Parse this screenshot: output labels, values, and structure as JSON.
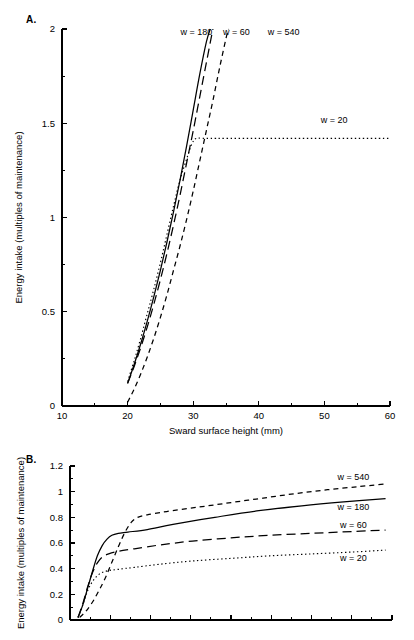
{
  "figure": {
    "panels": [
      {
        "letter": "A.",
        "xlabel": "Sward surface height (mm)",
        "ylabel": "Energy intake (multiples of maintenance)"
      },
      {
        "letter": "B.",
        "xlabel": "",
        "ylabel": "Energy intake (multiples of maintenance)"
      }
    ]
  },
  "chart_data": [
    {
      "type": "line",
      "panel": "A.",
      "title": "",
      "xlabel": "Sward surface height (mm)",
      "ylabel": "Energy intake (multiples of maintenance)",
      "xlim": [
        10,
        60
      ],
      "ylim": [
        0,
        2
      ],
      "xticks": [
        10,
        20,
        30,
        40,
        50,
        60
      ],
      "xticklabels": [
        "10",
        "20",
        "30",
        "40",
        "50",
        "60"
      ],
      "xminorticks": [
        15,
        25,
        35,
        45,
        55
      ],
      "yticks": [
        0,
        0.5,
        1,
        1.5,
        2
      ],
      "yticklabels": [
        "0",
        "0.5",
        "1",
        "1.5",
        "2"
      ],
      "yminorticks": [
        0.25,
        0.75,
        1.25,
        1.75
      ],
      "grid": false,
      "legend_position": "inline-top",
      "series": [
        {
          "name": "w = 180",
          "style": "solid",
          "label_x": 30.5,
          "label_y": 1.97,
          "points": [
            [
              20.0,
              0.12
            ],
            [
              21.0,
              0.22
            ],
            [
              22.0,
              0.33
            ],
            [
              23.0,
              0.45
            ],
            [
              24.0,
              0.58
            ],
            [
              25.0,
              0.72
            ],
            [
              26.0,
              0.87
            ],
            [
              27.0,
              1.03
            ],
            [
              28.0,
              1.2
            ],
            [
              29.0,
              1.38
            ],
            [
              30.0,
              1.57
            ],
            [
              31.0,
              1.76
            ],
            [
              32.0,
              1.93
            ],
            [
              32.6,
              2.0
            ]
          ]
        },
        {
          "name": "w = 60",
          "style": "longdash",
          "label_x": 36.6,
          "label_y": 1.97,
          "points": [
            [
              20.0,
              0.12
            ],
            [
              21.0,
              0.21
            ],
            [
              22.0,
              0.31
            ],
            [
              23.0,
              0.42
            ],
            [
              24.0,
              0.54
            ],
            [
              25.0,
              0.67
            ],
            [
              26.0,
              0.81
            ],
            [
              27.0,
              0.96
            ],
            [
              28.0,
              1.12
            ],
            [
              29.0,
              1.29
            ],
            [
              30.0,
              1.46
            ],
            [
              31.0,
              1.64
            ],
            [
              32.0,
              1.82
            ],
            [
              33.0,
              2.0
            ]
          ]
        },
        {
          "name": "w = 540",
          "style": "shortdash",
          "label_x": 43.8,
          "label_y": 1.97,
          "points": [
            [
              20.0,
              0.02
            ],
            [
              21.0,
              0.09
            ],
            [
              22.0,
              0.17
            ],
            [
              23.0,
              0.26
            ],
            [
              24.0,
              0.36
            ],
            [
              25.0,
              0.47
            ],
            [
              26.0,
              0.59
            ],
            [
              27.0,
              0.72
            ],
            [
              28.0,
              0.85
            ],
            [
              29.0,
              0.99
            ],
            [
              30.0,
              1.14
            ],
            [
              31.0,
              1.3
            ],
            [
              32.0,
              1.46
            ],
            [
              33.0,
              1.62
            ],
            [
              34.0,
              1.79
            ],
            [
              35.0,
              1.95
            ],
            [
              35.4,
              2.0
            ]
          ]
        },
        {
          "name": "w = 20",
          "style": "dotted",
          "label_x": 51.5,
          "label_y": 1.5,
          "points": [
            [
              20.0,
              0.13
            ],
            [
              21.0,
              0.24
            ],
            [
              22.0,
              0.36
            ],
            [
              23.0,
              0.49
            ],
            [
              24.0,
              0.62
            ],
            [
              25.0,
              0.76
            ],
            [
              26.0,
              0.91
            ],
            [
              27.0,
              1.06
            ],
            [
              28.0,
              1.2
            ],
            [
              29.0,
              1.31
            ],
            [
              29.8,
              1.39
            ],
            [
              30.5,
              1.42
            ],
            [
              32.0,
              1.42
            ],
            [
              40.0,
              1.42
            ],
            [
              50.0,
              1.42
            ],
            [
              60.0,
              1.42
            ]
          ]
        }
      ]
    },
    {
      "type": "line",
      "panel": "B.",
      "title": "",
      "xlabel": "",
      "ylabel": "Energy intake (multiples of maintenance)",
      "xlim": [
        0,
        100
      ],
      "ylim": [
        0,
        1.2
      ],
      "xticks": [
        0,
        12.5,
        25,
        37.5,
        50,
        62.5,
        75,
        87.5,
        100
      ],
      "xticklabels": [],
      "xminorticks": [
        6.25,
        18.75,
        31.25,
        43.75,
        56.25,
        68.75,
        81.25,
        93.75
      ],
      "yticks": [
        0,
        0.2,
        0.4,
        0.6,
        0.8,
        1,
        1.2
      ],
      "yticklabels": [
        "0",
        "0.2",
        "0.4",
        "0.6",
        "0.8",
        "1",
        "1.2"
      ],
      "yminorticks": [
        0.1,
        0.3,
        0.5,
        0.7,
        0.9,
        1.1
      ],
      "grid": false,
      "legend_position": "right-inline",
      "series": [
        {
          "name": "w = 540",
          "style": "shortdash",
          "label_x": 88,
          "label_y": 1.09,
          "points": [
            [
              3.0,
              0.02
            ],
            [
              5.0,
              0.07
            ],
            [
              7.0,
              0.14
            ],
            [
              9.0,
              0.23
            ],
            [
              11.0,
              0.33
            ],
            [
              13.0,
              0.45
            ],
            [
              15.0,
              0.57
            ],
            [
              17.0,
              0.68
            ],
            [
              19.0,
              0.76
            ],
            [
              21.0,
              0.8
            ],
            [
              24.0,
              0.82
            ],
            [
              30.0,
              0.845
            ],
            [
              40.0,
              0.88
            ],
            [
              50.0,
              0.915
            ],
            [
              60.0,
              0.95
            ],
            [
              70.0,
              0.985
            ],
            [
              80.0,
              1.015
            ],
            [
              90.0,
              1.04
            ],
            [
              98.0,
              1.06
            ]
          ]
        },
        {
          "name": "w = 180",
          "style": "solid",
          "label_x": 88,
          "label_y": 0.86,
          "points": [
            [
              2.5,
              0.02
            ],
            [
              4.0,
              0.12
            ],
            [
              5.5,
              0.25
            ],
            [
              7.0,
              0.38
            ],
            [
              8.5,
              0.5
            ],
            [
              10.0,
              0.58
            ],
            [
              11.5,
              0.63
            ],
            [
              13.0,
              0.66
            ],
            [
              15.0,
              0.675
            ],
            [
              18.0,
              0.685
            ],
            [
              24.0,
              0.705
            ],
            [
              32.0,
              0.745
            ],
            [
              45.0,
              0.8
            ],
            [
              58.0,
              0.85
            ],
            [
              72.0,
              0.89
            ],
            [
              85.0,
              0.92
            ],
            [
              98.0,
              0.945
            ]
          ]
        },
        {
          "name": "w = 60",
          "style": "longdash",
          "label_x": 88,
          "label_y": 0.72,
          "points": [
            [
              2.5,
              0.02
            ],
            [
              4.0,
              0.13
            ],
            [
              5.5,
              0.26
            ],
            [
              7.0,
              0.37
            ],
            [
              8.5,
              0.445
            ],
            [
              10.0,
              0.49
            ],
            [
              12.0,
              0.515
            ],
            [
              15.0,
              0.535
            ],
            [
              20.0,
              0.555
            ],
            [
              28.0,
              0.585
            ],
            [
              38.0,
              0.615
            ],
            [
              50.0,
              0.64
            ],
            [
              62.0,
              0.66
            ],
            [
              75.0,
              0.675
            ],
            [
              88.0,
              0.69
            ],
            [
              98.0,
              0.7
            ]
          ]
        },
        {
          "name": "w = 20",
          "style": "dotted",
          "label_x": 88,
          "label_y": 0.46,
          "points": [
            [
              2.5,
              0.02
            ],
            [
              4.0,
              0.12
            ],
            [
              5.5,
              0.23
            ],
            [
              7.0,
              0.3
            ],
            [
              8.5,
              0.345
            ],
            [
              10.0,
              0.37
            ],
            [
              12.0,
              0.385
            ],
            [
              15.0,
              0.395
            ],
            [
              20.0,
              0.41
            ],
            [
              28.0,
              0.435
            ],
            [
              38.0,
              0.46
            ],
            [
              50.0,
              0.48
            ],
            [
              62.0,
              0.5
            ],
            [
              75.0,
              0.515
            ],
            [
              88.0,
              0.53
            ],
            [
              98.0,
              0.545
            ]
          ]
        }
      ]
    }
  ]
}
